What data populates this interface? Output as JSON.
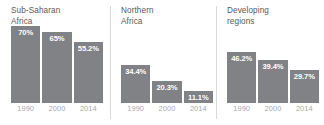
{
  "chart_data": {
    "type": "bar",
    "title": "",
    "xlabel": "",
    "ylabel": "",
    "ylim": [
      0,
      77
    ],
    "grid": false,
    "legend": "none",
    "categories": [
      "1990",
      "2000",
      "2014"
    ],
    "value_suffix": "%",
    "panels": [
      {
        "name": "Sub-Saharan Africa",
        "title": "Sub-Saharan\nAfrica",
        "categories": [
          "1990",
          "2000",
          "2014"
        ],
        "values": [
          70,
          65,
          55.2
        ],
        "value_labels": [
          "70%",
          "65%",
          "55.2%"
        ],
        "bar_heights_px": [
          70,
          65,
          55.2
        ]
      },
      {
        "name": "Northern Africa",
        "title": "Northern\nAfrica",
        "categories": [
          "1990",
          "2000",
          "2014"
        ],
        "values": [
          34.4,
          20.3,
          11.1
        ],
        "value_labels": [
          "34.4%",
          "20.3%",
          "11.1%"
        ],
        "bar_heights_px": [
          34.4,
          20.3,
          11.1
        ]
      },
      {
        "name": "Developing regions",
        "title": "Developing\nregions",
        "categories": [
          "1990",
          "2000",
          "2014"
        ],
        "values": [
          46.2,
          39.4,
          29.7
        ],
        "value_labels": [
          "46.2%",
          "39.4%",
          "29.7%"
        ],
        "bar_heights_px": [
          46.2,
          39.4,
          29.7
        ]
      }
    ]
  },
  "colors": {
    "bar": "#808285",
    "background": "#ffffff",
    "title_text": "#58585a",
    "axis_text": "#a7a9ac",
    "divider": "#d8d8d8",
    "value_text": "#ffffff"
  }
}
